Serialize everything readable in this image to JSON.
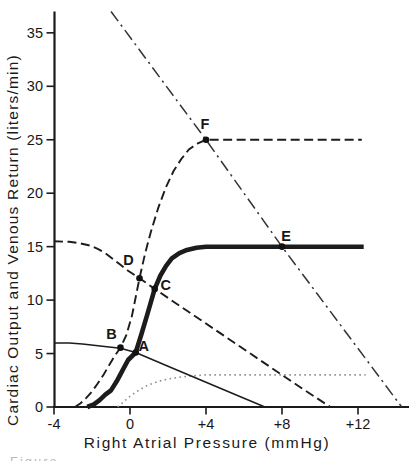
{
  "figure": {
    "caption_fragment": "Figure"
  },
  "colors": {
    "ink": "#1a1a1a",
    "dotted_curve": "#8f8f8f",
    "background": "#ffffff"
  },
  "chart_data": {
    "type": "line",
    "title": "",
    "xlabel": "Right Atrial Pressure (mmHg)",
    "ylabel": "Cardiac Output and Venous Return (liters/min)",
    "xlim": [
      -4,
      14.7
    ],
    "ylim": [
      0,
      37
    ],
    "grid": false,
    "legend": "none",
    "x_ticks": [
      {
        "v": -4,
        "label": "-4"
      },
      {
        "v": 0,
        "label": "0"
      },
      {
        "v": 4,
        "label": "+4"
      },
      {
        "v": 8,
        "label": "+8"
      },
      {
        "v": 12,
        "label": "+12"
      }
    ],
    "y_ticks": [
      {
        "v": 0,
        "label": "0"
      },
      {
        "v": 5,
        "label": "5"
      },
      {
        "v": 10,
        "label": "10"
      },
      {
        "v": 15,
        "label": "15"
      },
      {
        "v": 20,
        "label": "20"
      },
      {
        "v": 25,
        "label": "25"
      },
      {
        "v": 30,
        "label": "30"
      },
      {
        "v": 35,
        "label": "35"
      }
    ],
    "series": [
      {
        "id": "dotted-cardiac-output-curve-plateau-3",
        "style": "dotted",
        "points": [
          [
            -0.65,
            0
          ],
          [
            -0.35,
            0.45
          ],
          [
            0,
            1.0
          ],
          [
            0.4,
            1.5
          ],
          [
            0.9,
            2.0
          ],
          [
            1.5,
            2.4
          ],
          [
            2.1,
            2.65
          ],
          [
            2.7,
            2.82
          ],
          [
            3.3,
            2.92
          ],
          [
            4.0,
            3.0
          ],
          [
            12.4,
            3.0
          ]
        ]
      },
      {
        "id": "thin-solid-venous-return-curve-plateau-6",
        "style": "solid",
        "points": [
          [
            -4,
            6.0
          ],
          [
            -3.2,
            5.98
          ],
          [
            -2.5,
            5.9
          ],
          [
            -1.8,
            5.75
          ],
          [
            -1.1,
            5.62
          ],
          [
            -0.5,
            5.5
          ],
          [
            0.3,
            5.1
          ],
          [
            2.0,
            3.82
          ],
          [
            4.0,
            2.32
          ],
          [
            5.5,
            1.2
          ],
          [
            7.1,
            0
          ]
        ]
      },
      {
        "id": "dashed-venous-return-curve-plateau-15.5",
        "style": "dashed",
        "points": [
          [
            -4,
            15.5
          ],
          [
            -3.2,
            15.45
          ],
          [
            -2.6,
            15.3
          ],
          [
            -2.1,
            15.1
          ],
          [
            -1.7,
            14.8
          ],
          [
            -1.3,
            14.4
          ],
          [
            -0.9,
            13.85
          ],
          [
            -0.5,
            13.3
          ],
          [
            -0.1,
            12.75
          ],
          [
            0.5,
            12.05
          ],
          [
            1.3,
            11.05
          ],
          [
            3.0,
            9.0
          ],
          [
            5.0,
            6.6
          ],
          [
            7.0,
            4.2
          ],
          [
            9.0,
            1.8
          ],
          [
            10.55,
            0
          ]
        ]
      },
      {
        "id": "dash-dot-venous-return-line",
        "style": "dashdot",
        "points": [
          [
            -1.0,
            37.0
          ],
          [
            4.0,
            25.0
          ],
          [
            8.0,
            15.0
          ],
          [
            14.3,
            0
          ]
        ]
      },
      {
        "id": "dashed-cardiac-output-curve-plateau-25",
        "style": "dashed",
        "points": [
          [
            -2.9,
            0
          ],
          [
            -2.6,
            0.35
          ],
          [
            -2.3,
            0.85
          ],
          [
            -2.0,
            1.45
          ],
          [
            -1.7,
            2.2
          ],
          [
            -1.4,
            3.0
          ],
          [
            -1.1,
            3.9
          ],
          [
            -0.8,
            4.8
          ],
          [
            -0.5,
            5.55
          ],
          [
            -0.2,
            6.7
          ],
          [
            0.1,
            8.5
          ],
          [
            0.5,
            12.05
          ],
          [
            0.8,
            14.4
          ],
          [
            1.1,
            16.4
          ],
          [
            1.5,
            18.7
          ],
          [
            1.9,
            20.6
          ],
          [
            2.3,
            22.1
          ],
          [
            2.7,
            23.2
          ],
          [
            3.1,
            24.1
          ],
          [
            3.6,
            24.7
          ],
          [
            4.0,
            25.0
          ],
          [
            12.2,
            25.0
          ]
        ]
      },
      {
        "id": "thick-solid-cardiac-output-curve-plateau-15",
        "style": "thick",
        "points": [
          [
            -2.25,
            0
          ],
          [
            -1.9,
            0.25
          ],
          [
            -1.6,
            0.65
          ],
          [
            -1.3,
            1.15
          ],
          [
            -1.0,
            1.55
          ],
          [
            -0.7,
            2.4
          ],
          [
            -0.4,
            3.4
          ],
          [
            -0.1,
            4.4
          ],
          [
            0.3,
            5.1
          ],
          [
            0.6,
            6.8
          ],
          [
            0.9,
            8.6
          ],
          [
            1.3,
            11.05
          ],
          [
            1.6,
            12.3
          ],
          [
            1.9,
            13.2
          ],
          [
            2.2,
            13.9
          ],
          [
            2.6,
            14.4
          ],
          [
            3.0,
            14.7
          ],
          [
            3.5,
            14.9
          ],
          [
            4.0,
            15.0
          ],
          [
            12.3,
            15.0
          ]
        ]
      }
    ],
    "equilibrium_points": [
      {
        "label": "A",
        "x": 0.3,
        "y": 5.1,
        "dx": 8,
        "dy": -1
      },
      {
        "label": "B",
        "x": -0.5,
        "y": 5.55,
        "dx": -9,
        "dy": -9
      },
      {
        "label": "C",
        "x": 1.3,
        "y": 11.05,
        "dx": 11,
        "dy": 1
      },
      {
        "label": "D",
        "x": 0.5,
        "y": 12.05,
        "dx": -11,
        "dy": -13
      },
      {
        "label": "E",
        "x": 8.0,
        "y": 15.0,
        "dx": 4,
        "dy": -6
      },
      {
        "label": "F",
        "x": 4.0,
        "y": 25.0,
        "dx": -1,
        "dy": -11
      }
    ]
  }
}
